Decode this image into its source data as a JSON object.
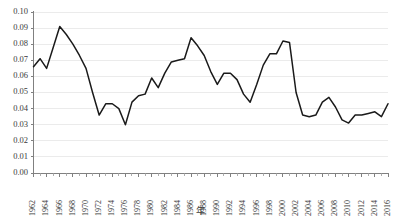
{
  "chart_data": {
    "type": "line",
    "title": "",
    "xlabel": "年",
    "ylabel": "",
    "xlim": [
      1962,
      2016
    ],
    "ylim": [
      0.0,
      0.1
    ],
    "grid": true,
    "legend": false,
    "y_ticks": [
      "0.00",
      "0.01",
      "0.02",
      "0.03",
      "0.04",
      "0.05",
      "0.06",
      "0.07",
      "0.08",
      "0.09",
      "0.10"
    ],
    "y_tick_values": [
      0.0,
      0.01,
      0.02,
      0.03,
      0.04,
      0.05,
      0.06,
      0.07,
      0.08,
      0.09,
      0.1
    ],
    "x_tick_labels": [
      "1962",
      "1964",
      "1966",
      "1968",
      "1970",
      "1972",
      "1974",
      "1976",
      "1978",
      "1980",
      "1982",
      "1984",
      "1986",
      "1988",
      "1990",
      "1992",
      "1994",
      "1996",
      "1998",
      "2000",
      "2002",
      "2004",
      "2006",
      "2008",
      "2010",
      "2012",
      "2014",
      "2016"
    ],
    "x_tick_interval": 2,
    "line_color": "#1a1a1a",
    "grid_color": "#e6e6e6",
    "axis_color": "#808080",
    "x": [
      1962,
      1963,
      1964,
      1965,
      1966,
      1967,
      1968,
      1969,
      1970,
      1971,
      1972,
      1973,
      1974,
      1975,
      1976,
      1977,
      1978,
      1979,
      1980,
      1981,
      1982,
      1983,
      1984,
      1985,
      1986,
      1987,
      1988,
      1989,
      1990,
      1991,
      1992,
      1993,
      1994,
      1995,
      1996,
      1997,
      1998,
      1999,
      2000,
      2001,
      2002,
      2003,
      2004,
      2005,
      2006,
      2007,
      2008,
      2009,
      2010,
      2011,
      2012,
      2013,
      2014,
      2015,
      2016
    ],
    "values": [
      0.066,
      0.071,
      0.065,
      0.078,
      0.091,
      0.086,
      0.08,
      0.073,
      0.065,
      0.05,
      0.036,
      0.043,
      0.043,
      0.04,
      0.03,
      0.044,
      0.048,
      0.049,
      0.059,
      0.053,
      0.062,
      0.069,
      0.07,
      0.071,
      0.084,
      0.079,
      0.073,
      0.063,
      0.055,
      0.062,
      0.062,
      0.058,
      0.049,
      0.044,
      0.055,
      0.067,
      0.074,
      0.074,
      0.082,
      0.081,
      0.05,
      0.036,
      0.035,
      0.036,
      0.044,
      0.047,
      0.041,
      0.033,
      0.031,
      0.036,
      0.036,
      0.037,
      0.038,
      0.035,
      0.043
    ]
  },
  "axes": {
    "x_axis_title": "年"
  }
}
